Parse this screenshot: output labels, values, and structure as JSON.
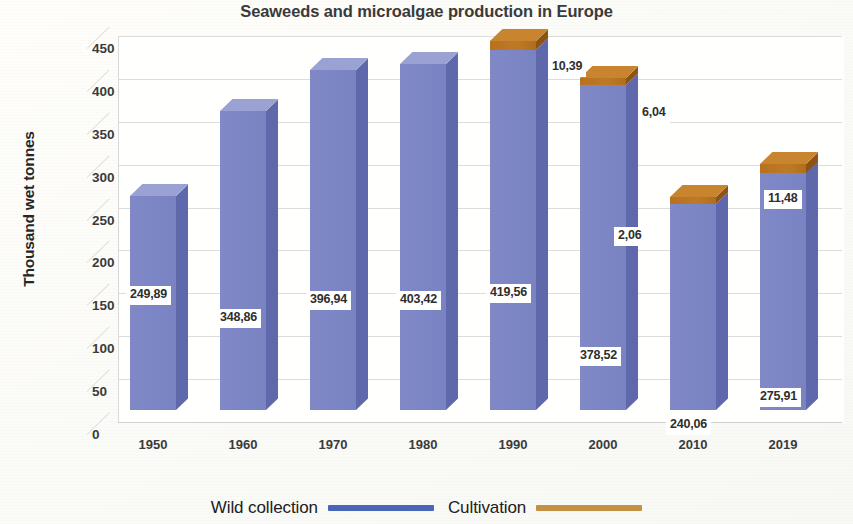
{
  "chart_data": {
    "type": "bar",
    "subtype": "stacked-column-3d",
    "title": "Seaweeds and microalgae production in Europe",
    "xlabel": "",
    "ylabel": "Thousand wet tonnes",
    "ylim": [
      0,
      450
    ],
    "ytick_step": 50,
    "yticks": [
      "450",
      "400",
      "350",
      "300",
      "250",
      "200",
      "150",
      "100",
      "50",
      "0"
    ],
    "grid": true,
    "legend_position": "bottom",
    "decimal_separator": ",",
    "categories": [
      "1950",
      "1960",
      "1970",
      "1980",
      "1990",
      "2000",
      "2010",
      "2019"
    ],
    "series": [
      {
        "name": "Wild collection",
        "color": "#7d86c5",
        "values": [
          249.89,
          348.86,
          396.94,
          403.42,
          419.56,
          378.52,
          240.06,
          275.91
        ],
        "labels": [
          "249,89",
          "348,86",
          "396,94",
          "403,42",
          "419,56",
          "378,52",
          "240,06",
          "275,91"
        ]
      },
      {
        "name": "Cultivation",
        "color": "#b8711f",
        "values": [
          null,
          null,
          null,
          null,
          10.39,
          6.04,
          2.06,
          11.48
        ],
        "labels": [
          "",
          "",
          "",
          "",
          "10,39",
          "6,04",
          "2,06",
          "11,48"
        ]
      }
    ]
  },
  "legend": {
    "items": [
      {
        "label": "Wild collection",
        "color": "#4a66b8"
      },
      {
        "label": "Cultivation",
        "color": "#c29142"
      }
    ]
  }
}
